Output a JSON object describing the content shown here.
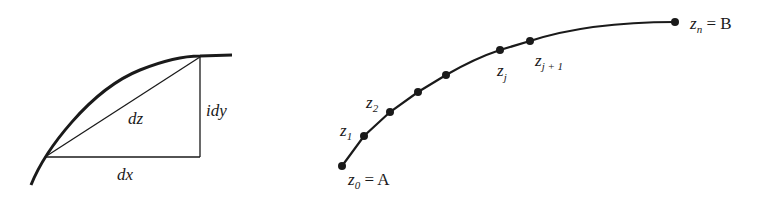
{
  "left_figure": {
    "labels": {
      "dz": "dz",
      "idy": "idy",
      "dx": "dx"
    }
  },
  "right_figure": {
    "points": [
      {
        "name": "z",
        "sub": "0",
        "suffix": " = A"
      },
      {
        "name": "z",
        "sub": "1"
      },
      {
        "name": "z",
        "sub": "2"
      },
      {
        "name": "z",
        "sub": "j"
      },
      {
        "name": "z",
        "sub": "j + 1"
      },
      {
        "name": "z",
        "sub": "n",
        "suffix": " = B"
      }
    ]
  }
}
